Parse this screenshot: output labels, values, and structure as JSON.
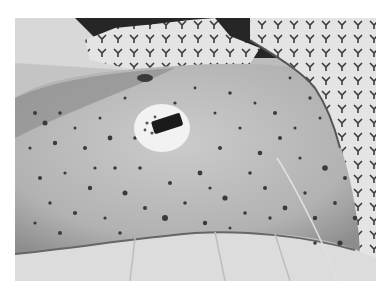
{
  "image": {
    "description": "Grayscale clinical photograph of a patient's torso/flank skin covered with numerous dark petechial/purpuric spots, a round white dressing with a dark central device, a patterned hospital gown at top, white sheets at bottom and a thin wire running down the right side.",
    "colors": {
      "skin": "#b4b4b4",
      "skin_light": "#c8c8c8",
      "spots": "#3a3a3a",
      "background_dark": "#262626",
      "gown": "#e6e6e6",
      "gown_pattern": "#3c3c3c",
      "sheet": "#dedede",
      "dressing": "#f2f2f2",
      "device": "#1a1a1a",
      "wire": "#e0e0e0",
      "frame_border": "#ffffff"
    },
    "regions": [
      {
        "name": "dark-background",
        "position": "top strip"
      },
      {
        "name": "hospital-gown-left",
        "position": "top-center"
      },
      {
        "name": "hospital-gown-right",
        "position": "top-right corner"
      },
      {
        "name": "skin-area",
        "position": "center"
      },
      {
        "name": "dressing-with-device",
        "position": "center-left, around (162,125)"
      },
      {
        "name": "wire",
        "position": "right side, curving downward"
      },
      {
        "name": "bed-sheet",
        "position": "bottom strip"
      }
    ]
  }
}
